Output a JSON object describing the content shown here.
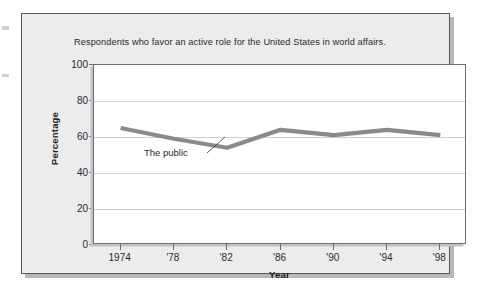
{
  "figure": {
    "title": "Respondents who favor an active role for the United States in world affairs.",
    "colors": {
      "line": "#8a8a8c",
      "plot_background": "#ffffff",
      "figure_background": "#ececed",
      "gridline": "#cfcfd1",
      "axis": "#6e6e70",
      "text": "#2a2a2c"
    }
  },
  "chart_data": {
    "type": "line",
    "title": "Respondents who favor an active role for the United States in world affairs.",
    "xlabel": "Year",
    "ylabel": "Percentage",
    "xlim": [
      1972,
      2000
    ],
    "ylim": [
      0,
      100
    ],
    "yticks": [
      0,
      20,
      40,
      60,
      80,
      100
    ],
    "ytick_labels": [
      "0",
      "20",
      "40",
      "60",
      "80",
      "100"
    ],
    "xticks": [
      1974,
      1978,
      1982,
      1986,
      1990,
      1994,
      1998
    ],
    "xtick_labels": [
      "1974",
      "'78",
      "'82",
      "'86",
      "'90",
      "'94",
      "'98"
    ],
    "grid": "horizontal",
    "legend": "none",
    "annotations": [
      {
        "text": "The public",
        "points_to_x": 1982,
        "points_to_y": 54
      }
    ],
    "series": [
      {
        "name": "The public",
        "color": "#8a8a8c",
        "x": [
          1974,
          1978,
          1982,
          1986,
          1990,
          1994,
          1998
        ],
        "values": [
          65,
          59,
          54,
          64,
          61,
          64,
          61
        ]
      }
    ]
  }
}
